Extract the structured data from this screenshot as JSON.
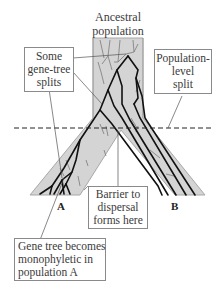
{
  "title": {
    "line1": "Ancestral",
    "line2": "population"
  },
  "labels": {
    "gene_tree_splits": [
      "Some",
      "gene-tree",
      "splits"
    ],
    "population_split": [
      "Population-",
      "level",
      "split"
    ],
    "barrier": [
      "Barrier to",
      "dispersal",
      "forms here"
    ],
    "monophyletic": [
      "Gene tree becomes",
      "monophyletic in",
      "population A"
    ]
  },
  "populations": {
    "a": "A",
    "b": "B"
  },
  "colors": {
    "population_fill": "#d4d4d4",
    "population_edge": "#a8a8a8",
    "gene_lineage": "#111111",
    "extinct_lineage": "#7a7a7a",
    "box_border": "#8a8a8a",
    "text": "#3a3a3a"
  }
}
